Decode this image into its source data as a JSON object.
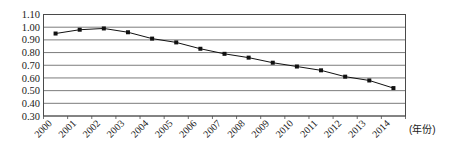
{
  "chart_data": {
    "type": "line",
    "title": "",
    "xlabel": "(年份)",
    "ylabel": "",
    "categories": [
      "2000",
      "2001",
      "2002",
      "2003",
      "2004",
      "2005",
      "2006",
      "2007",
      "2008",
      "2009",
      "2010",
      "2011",
      "2012",
      "2013",
      "2014"
    ],
    "values": [
      0.95,
      0.98,
      0.99,
      0.96,
      0.91,
      0.88,
      0.83,
      0.79,
      0.76,
      0.72,
      0.69,
      0.66,
      0.61,
      0.58,
      0.52
    ],
    "series": [
      {
        "name": "",
        "values": [
          0.95,
          0.98,
          0.99,
          0.96,
          0.91,
          0.88,
          0.83,
          0.79,
          0.76,
          0.72,
          0.69,
          0.66,
          0.61,
          0.58,
          0.52
        ]
      }
    ],
    "ylim": [
      0.3,
      1.1
    ],
    "ytick_labels": [
      "1.10",
      "1.00",
      "0.90",
      "0.80",
      "0.70",
      "0.60",
      "0.50",
      "0.40",
      "0.30"
    ],
    "ytick_values": [
      1.1,
      1.0,
      0.9,
      0.8,
      0.7,
      0.6,
      0.5,
      0.4,
      0.3
    ],
    "grid": "horizontal",
    "legend": "none",
    "marker": "square",
    "line_color": "#111111",
    "marker_color": "#111111",
    "grid_color": "#5a5a5a",
    "x_label_rotation": "-45"
  },
  "axis": {
    "x_unit_annotation": "(年份)"
  }
}
